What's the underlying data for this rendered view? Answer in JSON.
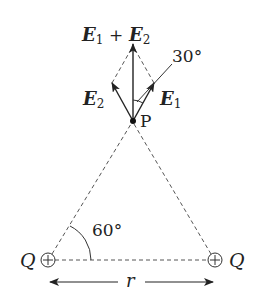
{
  "diagram": {
    "title": "",
    "labels": {
      "sum_E": "E",
      "sum_sub1": "1",
      "sum_plus": "+",
      "sum_E2": "E",
      "sum_sub2": "2",
      "E1": "E",
      "E1_sub": "1",
      "E2": "E",
      "E2_sub": "2",
      "angle_top": "30°",
      "point": "P",
      "angle_base": "60°",
      "charge_left": "Q",
      "charge_right": "Q",
      "distance": "r"
    },
    "colors": {
      "line": "#333333",
      "dash": "#555555",
      "background": "#ffffff"
    }
  }
}
